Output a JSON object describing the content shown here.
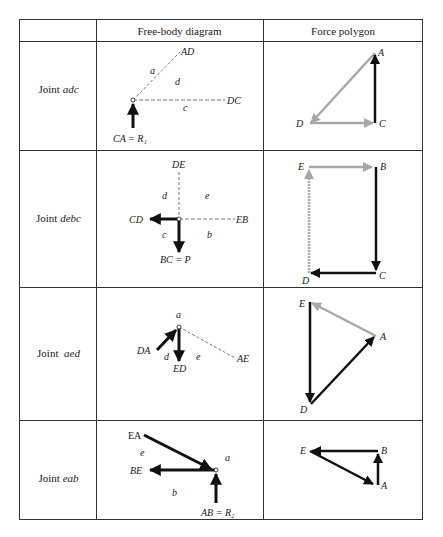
{
  "table": {
    "headers": [
      "",
      "Free-body diagram",
      "Force polygon"
    ],
    "rows": [
      {
        "joint_prefix": "Joint",
        "joint_name": "adc",
        "fbd_labels": {
          "top": "AD",
          "right": "DC",
          "bottom": "CA = R₁",
          "regions": [
            "a",
            "d",
            "c"
          ]
        },
        "polygon_labels": [
          "A",
          "D",
          "C"
        ]
      },
      {
        "joint_prefix": "Joint",
        "joint_name": "debc",
        "fbd_labels": {
          "top": "DE",
          "left": "CD",
          "right": "EB",
          "bottom": "BC = P",
          "regions": [
            "d",
            "e",
            "c",
            "b"
          ]
        },
        "polygon_labels": [
          "E",
          "B",
          "C",
          "D"
        ]
      },
      {
        "joint_prefix": "Joint",
        "joint_name": "aed",
        "fbd_labels": {
          "left": "DA",
          "bottom": "ED",
          "right": "AE",
          "regions": [
            "a",
            "d",
            "e"
          ]
        },
        "polygon_labels": [
          "E",
          "A",
          "D"
        ]
      },
      {
        "joint_prefix": "Joint",
        "joint_name": "eab",
        "fbd_labels": {
          "top": "EA",
          "left": "BE",
          "bottom": "AB = R₂",
          "regions": [
            "e",
            "a",
            "b"
          ]
        },
        "polygon_labels": [
          "E",
          "B",
          "A"
        ]
      }
    ]
  },
  "colors": {
    "line": "#333333",
    "force_black": "#111111",
    "force_gray": "#a8a8a8",
    "dashed": "#555555"
  }
}
